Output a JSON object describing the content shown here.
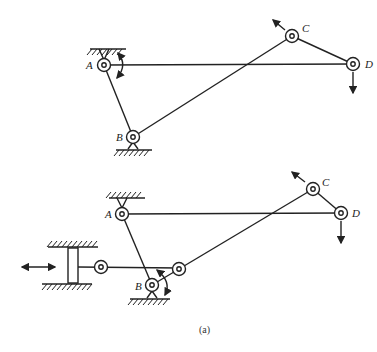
{
  "diagram": {
    "top_mechanism": {
      "labels": {
        "A": "A",
        "B": "B",
        "C": "C",
        "D": "D"
      }
    },
    "bottom_mechanism": {
      "labels": {
        "A": "A",
        "B": "B",
        "C": "C",
        "D": "D"
      }
    },
    "caption": "(a)",
    "stroke_color": "#222222"
  }
}
